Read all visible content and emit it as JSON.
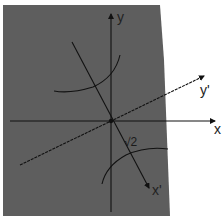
{
  "diagram": {
    "colors": {
      "background": "#ffffff",
      "panel": "#5e5e5e",
      "line": "#111111",
      "label": "#222222"
    },
    "axes": {
      "x": {
        "label": "x"
      },
      "y": {
        "label": "y"
      },
      "x_prime": {
        "label": "x'"
      },
      "y_prime": {
        "label": "y'"
      }
    },
    "annotations": {
      "vertex_distance": "√2"
    }
  }
}
